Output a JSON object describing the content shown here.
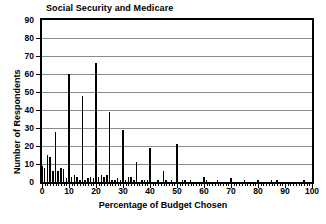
{
  "chart_data": {
    "type": "bar",
    "title": "Social Security and Medicare",
    "xlabel": "Percentage of Budget Chosen",
    "ylabel": "Number of Respondents",
    "xlim": [
      0,
      100
    ],
    "ylim": [
      0,
      90
    ],
    "xticks": [
      0,
      10,
      20,
      30,
      40,
      50,
      60,
      70,
      80,
      90,
      100
    ],
    "yticks": [
      0,
      10,
      20,
      30,
      40,
      50,
      60,
      70,
      80,
      90
    ],
    "grid": "horizontal",
    "legend": "none",
    "bar_color": "#000000",
    "x": [
      0,
      1,
      2,
      3,
      4,
      5,
      6,
      7,
      8,
      9,
      10,
      11,
      12,
      13,
      14,
      15,
      16,
      17,
      18,
      19,
      20,
      21,
      22,
      23,
      24,
      25,
      26,
      27,
      28,
      29,
      30,
      31,
      32,
      33,
      34,
      35,
      36,
      37,
      38,
      39,
      40,
      41,
      42,
      43,
      44,
      45,
      46,
      47,
      48,
      49,
      50,
      51,
      52,
      53,
      54,
      55,
      56,
      57,
      58,
      59,
      60,
      61,
      62,
      63,
      64,
      65,
      66,
      67,
      68,
      69,
      70,
      71,
      72,
      73,
      74,
      75,
      76,
      77,
      78,
      79,
      80,
      81,
      82,
      83,
      84,
      85,
      86,
      87,
      88,
      89,
      90,
      91,
      92,
      93,
      94,
      95,
      96,
      97,
      98,
      99,
      100
    ],
    "values": [
      9,
      8,
      15,
      14,
      6,
      28,
      6,
      8,
      7,
      2,
      60,
      3,
      4,
      3,
      1,
      48,
      1,
      2,
      3,
      2,
      66,
      3,
      4,
      3,
      4,
      39,
      1,
      1,
      2,
      1,
      29,
      1,
      3,
      3,
      1,
      11,
      0,
      1,
      1,
      1,
      19,
      0,
      0,
      1,
      0,
      6,
      1,
      0,
      1,
      0,
      21,
      0,
      1,
      1,
      0,
      1,
      0,
      0,
      0,
      0,
      3,
      1,
      0,
      0,
      0,
      1,
      0,
      0,
      0,
      0,
      2,
      0,
      0,
      0,
      0,
      1,
      0,
      0,
      0,
      0,
      1,
      0,
      0,
      0,
      0,
      1,
      0,
      1,
      0,
      0,
      0,
      0,
      0,
      0,
      0,
      0,
      0,
      1,
      0,
      0,
      0
    ]
  },
  "axes": {
    "y_ticks": [
      "0",
      "10",
      "20",
      "30",
      "40",
      "50",
      "60",
      "70",
      "80",
      "90"
    ],
    "x_ticks": [
      "0",
      "10",
      "20",
      "30",
      "40",
      "50",
      "60",
      "70",
      "80",
      "90",
      "100"
    ]
  }
}
